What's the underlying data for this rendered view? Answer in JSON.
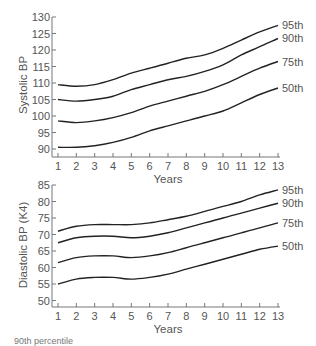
{
  "chart_data": [
    {
      "type": "line",
      "title": "",
      "xlabel": "Years",
      "ylabel": "Systolic BP",
      "x": [
        1,
        2,
        3,
        4,
        5,
        6,
        7,
        8,
        9,
        10,
        11,
        12,
        13
      ],
      "xticks": [
        "1",
        "2",
        "3",
        "4",
        "5",
        "6",
        "7",
        "8",
        "9",
        "10",
        "11",
        "12",
        "13"
      ],
      "yticks": [
        "90",
        "95",
        "100",
        "105",
        "110",
        "115",
        "120",
        "125",
        "130"
      ],
      "ylim": [
        88,
        130
      ],
      "grid": false,
      "legend_position": "inline-right",
      "series": [
        {
          "name": "95th",
          "values": [
            109.5,
            109,
            109.5,
            111,
            113,
            114.5,
            116,
            117.5,
            118.5,
            120.5,
            123,
            125.5,
            127.5
          ]
        },
        {
          "name": "90th",
          "values": [
            105,
            104.5,
            105,
            106,
            108,
            109.5,
            111,
            112,
            113.5,
            115.5,
            118.5,
            121,
            123.5
          ]
        },
        {
          "name": "75th",
          "values": [
            98.5,
            98,
            98.5,
            99.5,
            101,
            103,
            104.5,
            106,
            107.5,
            109.5,
            112,
            114.5,
            116.5
          ]
        },
        {
          "name": "50th",
          "values": [
            90.5,
            90.5,
            91,
            92,
            93.5,
            95.5,
            97,
            98.5,
            100,
            101.5,
            104,
            106.5,
            108.5
          ]
        }
      ]
    },
    {
      "type": "line",
      "title": "",
      "xlabel": "Years",
      "ylabel": "Diastolic BP (K4)",
      "x": [
        1,
        2,
        3,
        4,
        5,
        6,
        7,
        8,
        9,
        10,
        11,
        12,
        13
      ],
      "xticks": [
        "1",
        "2",
        "3",
        "4",
        "5",
        "6",
        "7",
        "8",
        "9",
        "10",
        "11",
        "12",
        "13"
      ],
      "yticks": [
        "50",
        "55",
        "60",
        "65",
        "70",
        "75",
        "80",
        "85"
      ],
      "ylim": [
        48,
        85
      ],
      "grid": false,
      "legend_position": "inline-right",
      "series": [
        {
          "name": "95th",
          "values": [
            71,
            72.5,
            73,
            73,
            73,
            73.5,
            74.5,
            75.5,
            77,
            78.5,
            80,
            82,
            83.5
          ]
        },
        {
          "name": "90th",
          "values": [
            67.5,
            69,
            69.5,
            69.5,
            69,
            69.5,
            70.5,
            72,
            73.5,
            75,
            76.5,
            78,
            79.5
          ]
        },
        {
          "name": "75th",
          "values": [
            61.5,
            63,
            63.5,
            63.5,
            63,
            63.5,
            64.5,
            66,
            67.5,
            69,
            70.5,
            72,
            73.5
          ]
        },
        {
          "name": "50th",
          "values": [
            55,
            56.5,
            57,
            57,
            56.5,
            57,
            58,
            59.5,
            61,
            62.5,
            64,
            65.5,
            66.5
          ]
        }
      ]
    }
  ],
  "footer": {
    "caption_fragment": "90th percentile"
  },
  "colors": {
    "curve": "#222222",
    "axis": "#777777",
    "text": "#555555"
  }
}
